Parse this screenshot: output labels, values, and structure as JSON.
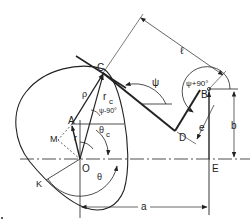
{
  "diagram": {
    "type": "cam-follower-mechanism",
    "colors": {
      "line": "#222222",
      "background": "#ffffff"
    },
    "points": {
      "C": "C",
      "A": "A",
      "M": "M",
      "O": "O",
      "K": "K",
      "B": "B",
      "D": "D",
      "E": "E"
    },
    "labels": {
      "rho": "ρ",
      "r_c": "r",
      "r_c_sub": "c",
      "r": "r",
      "psi": "ψ",
      "psi_minus_90": "ψ-90°",
      "psi_plus_90": "ψ+90°",
      "theta": "θ",
      "theta_c": "θ",
      "theta_c_sub": "c",
      "ell": "ℓ",
      "e": "e",
      "a": "a",
      "b": "b"
    }
  }
}
